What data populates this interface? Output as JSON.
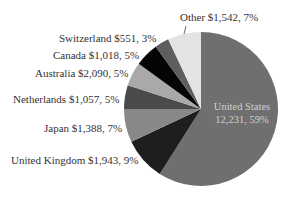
{
  "chart_data": {
    "type": "pie",
    "title": "",
    "start_angle_deg": 0,
    "direction": "clockwise",
    "slices": [
      {
        "name": "United States",
        "value": 12231,
        "percent": 59,
        "label": "United States",
        "label2": "12,231, 59%",
        "color": "#6f6f6f"
      },
      {
        "name": "United Kingdom",
        "value": 1943,
        "percent": 9,
        "label": "United Kingdom $1,943,  9%",
        "color": "#1e1e1e"
      },
      {
        "name": "Japan",
        "value": 1388,
        "percent": 7,
        "label": "Japan $1,388,  7%",
        "color": "#888888"
      },
      {
        "name": "Netherlands",
        "value": 1057,
        "percent": 5,
        "label": "Netherlands $1,057,  5%",
        "color": "#4a4a4a"
      },
      {
        "name": "Australia",
        "value": 2090,
        "percent": 5,
        "label": "Australia $2,090,  5%",
        "color": "#a9a9a9"
      },
      {
        "name": "Canada",
        "value": 1018,
        "percent": 5,
        "label": "Canada $1,018,  5%",
        "color": "#050505"
      },
      {
        "name": "Switzerland",
        "value": 551,
        "percent": 3,
        "label": "Switzerland $551,  3%",
        "color": "#5e5e5e"
      },
      {
        "name": "Other",
        "value": 1542,
        "percent": 7,
        "label": "Other $1,542,  7%",
        "color": "#e3e3e3"
      }
    ],
    "legend": "none (labels placed beside slices)"
  }
}
